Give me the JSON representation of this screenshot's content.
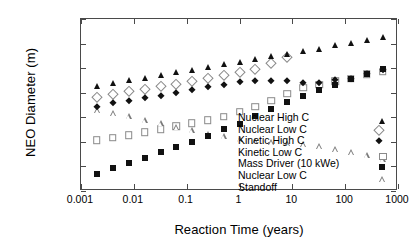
{
  "chart_data": {
    "type": "scatter",
    "title": "",
    "xlabel": "Reaction Time (years)",
    "ylabel": "NEO Diameter (m)",
    "xscale": "log",
    "yscale": "log",
    "xlim": [
      0.001,
      1000
    ],
    "ylim": [
      0.1,
      1000000
    ],
    "grid": false,
    "legend_position": "inside-right",
    "xticks": [
      "0.001",
      "0.01",
      "0.1",
      "1",
      "10",
      "100",
      "1000"
    ],
    "xtick_values": [
      0.001,
      0.01,
      0.1,
      1,
      10,
      100,
      1000
    ],
    "yticks": [
      "0.1",
      "1",
      "10",
      "100",
      "1000",
      "10000",
      "100000",
      "1000000"
    ],
    "ytick_values": [
      0.1,
      1,
      10,
      100,
      1000,
      10000,
      100000,
      1000000
    ],
    "x": [
      0.002,
      0.004,
      0.008,
      0.016,
      0.032,
      0.064,
      0.125,
      0.25,
      0.5,
      1,
      2,
      4,
      8,
      16,
      32,
      64,
      128,
      256,
      512
    ],
    "series": [
      {
        "name": "Nuclear High C",
        "marker": "filled-triangle",
        "color": "#111111",
        "values": [
          1950,
          2600,
          3250,
          4100,
          5200,
          6700,
          8600,
          11000,
          14500,
          18000,
          22500,
          30000,
          37000,
          49000,
          62000,
          85000,
          108000,
          135000,
          180000
        ]
      },
      {
        "name": "Nuclear Low C",
        "marker": "open-diamond",
        "color": "#8a8a8a",
        "values": [
          640,
          880,
          1150,
          1400,
          1800,
          2250,
          2900,
          4000,
          5200,
          7000,
          9500,
          16000,
          28000,
          null,
          null,
          null,
          null,
          null,
          null
        ]
      },
      {
        "name": "Kinetic High C",
        "marker": "filled-diamond",
        "color": "#111111",
        "values": [
          270,
          380,
          480,
          600,
          720,
          1000,
          1300,
          1650,
          2050,
          2750,
          3000,
          3050,
          3050,
          2450,
          2600,
          3150,
          3700,
          5700,
          8200
        ]
      },
      {
        "name": "Kinetic Low C",
        "marker": "open-square",
        "color": "#8a8a8a",
        "values": [
          12,
          15,
          19,
          25,
          33,
          43,
          57,
          75,
          105,
          170,
          270,
          470,
          900,
          1600,
          2100,
          2900,
          3700,
          5600,
          7200
        ]
      },
      {
        "name": "Mass Driver (10 kWe)",
        "marker": "filled-square",
        "color": "#111111",
        "values": [
          0.5,
          0.85,
          1.4,
          2.2,
          3.9,
          6.4,
          10.2,
          17.5,
          32,
          55,
          110,
          225,
          400,
          730,
          1300,
          2050,
          3500,
          5700,
          9000
        ]
      },
      {
        "name": "Nuclear Low C Standoff",
        "name_line1": "Nuclear Low C",
        "name_line2": "Standoff",
        "marker": "open-triangle",
        "color": "#7a7a7a",
        "values": [
          195,
          265,
          340,
          430,
          540,
          700,
          900,
          1100,
          1600,
          2050,
          3000,
          4800,
          7500,
          12000,
          18000,
          23500,
          31000,
          42000,
          50000
        ]
      }
    ]
  },
  "legend": {
    "items": [
      {
        "label": "Nuclear High C",
        "marker": "filled-triangle"
      },
      {
        "label": "Nuclear Low C",
        "marker": "open-diamond"
      },
      {
        "label": "Kinetic High C",
        "marker": "filled-diamond"
      },
      {
        "label": "Kinetic Low C",
        "marker": "open-square"
      },
      {
        "label": "Mass Driver (10 kWe)",
        "marker": "filled-square"
      },
      {
        "label": "Nuclear Low C",
        "label2": "Standoff",
        "marker": "open-triangle"
      }
    ]
  }
}
